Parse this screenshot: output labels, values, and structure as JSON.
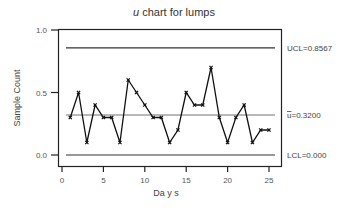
{
  "chart_data": {
    "type": "line",
    "title_italic": "u",
    "title_rest": " chart for lumps",
    "title": "u chart for lumps",
    "xlabel": "Da y s",
    "ylabel": "Sample Count",
    "xlim": [
      0,
      26
    ],
    "ylim": [
      -0.1,
      1.05
    ],
    "xticks": [
      0,
      5,
      10,
      15,
      20,
      25
    ],
    "xtick_labels": [
      "0",
      "5",
      "10",
      "15",
      "20",
      "25"
    ],
    "yticks": [
      0.0,
      0.5,
      1.0
    ],
    "ytick_labels": [
      "0.0",
      "0.5",
      "1.0"
    ],
    "grid": false,
    "x": [
      1,
      2,
      3,
      4,
      5,
      6,
      7,
      8,
      9,
      10,
      11,
      12,
      13,
      14,
      15,
      16,
      17,
      18,
      19,
      20,
      21,
      22,
      23,
      24,
      25
    ],
    "values": [
      0.3,
      0.5,
      0.1,
      0.4,
      0.3,
      0.3,
      0.1,
      0.6,
      0.5,
      0.4,
      0.3,
      0.3,
      0.1,
      0.2,
      0.5,
      0.4,
      0.4,
      0.7,
      0.3,
      0.1,
      0.3,
      0.4,
      0.1,
      0.2,
      0.2
    ],
    "control_limits": {
      "ucl": {
        "value": 0.8567,
        "label": "UCL=0.8567"
      },
      "center": {
        "value": 0.32,
        "label_symbol": "u",
        "label": "=0.3200"
      },
      "lcl": {
        "value": 0.0,
        "label": "LCL=0.000"
      }
    },
    "colors": {
      "series": "#111111",
      "ucl": "#333333",
      "center": "#a0a0a0",
      "lcl": "#333333",
      "frame": "#222222"
    }
  }
}
